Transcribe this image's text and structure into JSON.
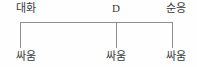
{
  "diagram": {
    "type": "bracket-tree",
    "background_color": "#fefefe",
    "line_color": "#8f8f8f",
    "text_color": "#3a3a3a",
    "top_row": [
      {
        "label": "대화",
        "x": 26,
        "script": "hangul"
      },
      {
        "label": "D",
        "x": 116,
        "script": "latin"
      },
      {
        "label": "순응",
        "x": 176,
        "script": "hangul"
      }
    ],
    "bottom_row": [
      {
        "label": "싸움",
        "x": 26,
        "script": "hangul"
      },
      {
        "label": "싸움",
        "x": 116,
        "script": "hangul"
      },
      {
        "label": "싸움",
        "x": 176,
        "script": "hangul"
      }
    ],
    "connectors": {
      "horizontal_bar": {
        "x": 20,
        "y": 22,
        "width": 153
      },
      "verticals": [
        {
          "x": 20,
          "y": 22,
          "height": 26
        },
        {
          "x": 116,
          "y": 22,
          "height": 26
        },
        {
          "x": 172,
          "y": 22,
          "height": 26
        }
      ]
    }
  }
}
